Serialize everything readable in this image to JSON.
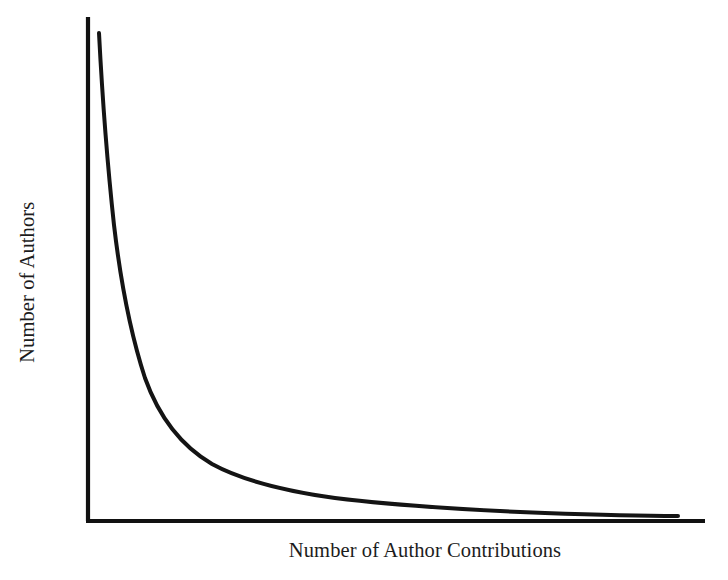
{
  "figure": {
    "background_color": "#ffffff",
    "line_color": "#141414",
    "axis_color": "#111111"
  },
  "chart_data": {
    "type": "line",
    "title": "",
    "subtitle": "",
    "xlabel": "Number of Author Contributions",
    "ylabel": "Number of Authors",
    "legend": [],
    "legend_position": "none",
    "grid": false,
    "xticks": [],
    "yticks": [],
    "xticklabels": [],
    "yticklabels": [],
    "xlim": [
      0,
      100
    ],
    "ylim": [
      0,
      100
    ],
    "annotations": [],
    "series": [
      {
        "name": "Author contribution distribution",
        "color": "#141414",
        "x": [
          0.8,
          1.2,
          1.8,
          2.6,
          3.6,
          5.0,
          6.8,
          8.6,
          11.0,
          14.0,
          17.5,
          22.0,
          27.0,
          33.0,
          40.0,
          48.0,
          56.0,
          65.0,
          75.0,
          85.0,
          95.0
        ],
        "y": [
          97.0,
          88.0,
          76.0,
          64.0,
          54.0,
          44.0,
          36.0,
          30.0,
          24.5,
          20.0,
          16.5,
          13.5,
          11.5,
          10.0,
          8.5,
          7.0,
          6.0,
          5.0,
          4.0,
          3.0,
          2.0
        ]
      }
    ],
    "curve_path_pixels": "M 99,33 C 103,110 108,170 114,225 C 121,285 131,335 145,378 C 160,420 183,447 212,464 C 243,481 285,491 335,498 C 400,506 470,510 545,513 C 600,515 645,516 678,516"
  },
  "axes_geometry": {
    "y_axis": {
      "x": 88,
      "y_top": 17,
      "y_bottom": 521
    },
    "x_axis": {
      "y": 521,
      "x_left": 86,
      "x_right": 705
    }
  }
}
